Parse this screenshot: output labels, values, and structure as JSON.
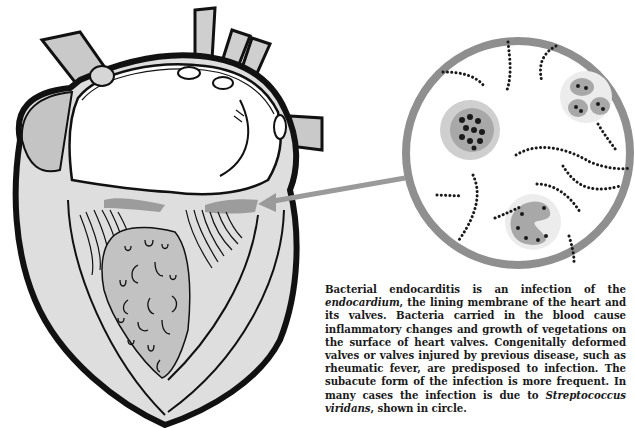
{
  "figure": {
    "subject": "Bacterial endocarditis",
    "elements": {
      "heart": "heart-cross-section-illustration",
      "magnifier": "bacteria-magnification-circle",
      "pointer": "arrow-pointing-to-valve-vegetations"
    },
    "colors": {
      "outline": "#111111",
      "gray_fill": "#bdbdbd",
      "light_fill": "#dcdcdc",
      "circle_ring": "#8f8f8f",
      "arrow": "#9a9a9a",
      "bacteria": "#1a1a1a",
      "background": "#ffffff"
    }
  },
  "caption": {
    "part1": "Bacterial endocarditis is an infection of the ",
    "term1": "endocardium",
    "part2": ", the lining membrane of the heart and its valves. Bacteria carried in the blood cause inflammatory changes and growth of vegetations on the surface of heart valves. Congenitally deformed valves or valves injured by previous disease, such as rheumatic fever, are predisposed to infection. The subacute form of the infection is more frequent. In many cases the infection is due to ",
    "term2": "Streptococcus viridans",
    "part3": ", shown in circle."
  }
}
